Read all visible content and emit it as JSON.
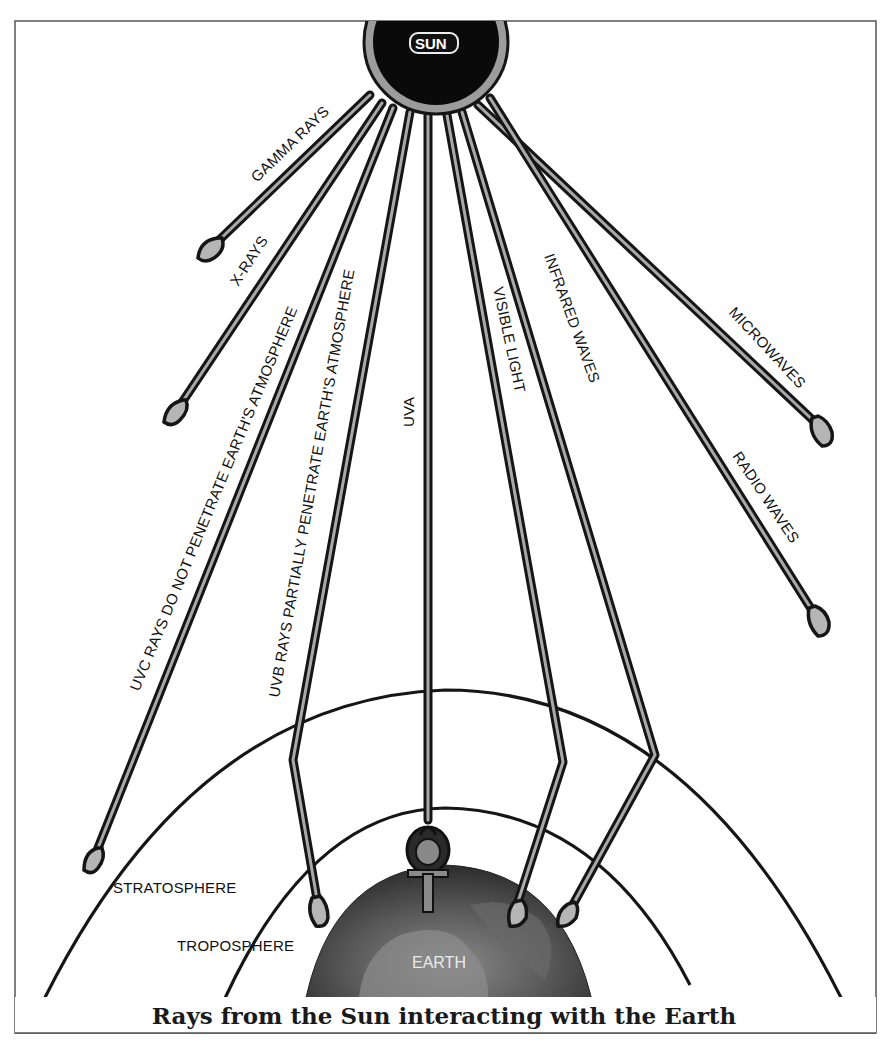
{
  "diagram": {
    "title": "Rays from the Sun interacting with the Earth",
    "sun": {
      "label": "SUN",
      "fill": "#0a0a0a",
      "ring": "#9c9c9c"
    },
    "earth": {
      "label": "EARTH",
      "fill": "#3e3e3e"
    },
    "layers": {
      "stratosphere": "STRATOSPHERE",
      "troposphere": "TROPOSPHERE"
    },
    "rays": [
      {
        "id": "gamma",
        "label": "GAMMA RAYS",
        "reaches_earth": false
      },
      {
        "id": "xray",
        "label": "X-RAYS",
        "reaches_earth": false
      },
      {
        "id": "uvc",
        "label": "UVC RAYS DO NOT PENETRATE EARTH'S ATMOSPHERE",
        "reaches_earth": false
      },
      {
        "id": "uvb",
        "label": "UVB RAYS PARTIALLY PENETRATE EARTH'S ATMOSPHERE",
        "reaches_earth": true
      },
      {
        "id": "uva",
        "label": "UVA",
        "reaches_earth": true
      },
      {
        "id": "visible",
        "label": "VISIBLE LIGHT",
        "reaches_earth": true
      },
      {
        "id": "infrared",
        "label": "INFRARED WAVES",
        "reaches_earth": true
      },
      {
        "id": "microwaves",
        "label": "MICROWAVES",
        "reaches_earth": false
      },
      {
        "id": "radio",
        "label": "RADIO WAVES",
        "reaches_earth": false
      }
    ],
    "symbol": {
      "name": "ankh-icon"
    },
    "colors": {
      "ink": "#151515",
      "ray_core": "#a9a9a9",
      "background": "#ffffff",
      "frame": "#555555"
    }
  }
}
